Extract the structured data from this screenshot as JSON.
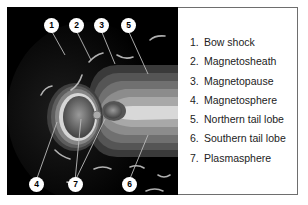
{
  "figure": {
    "panel_background": "#000000",
    "callouts": [
      {
        "id": "1",
        "x": 44,
        "y": 19
      },
      {
        "id": "2",
        "x": 69,
        "y": 19
      },
      {
        "id": "3",
        "x": 94,
        "y": 19
      },
      {
        "id": "4",
        "x": 29,
        "y": 178
      },
      {
        "id": "7",
        "x": 68,
        "y": 178
      },
      {
        "id": "5",
        "x": 121,
        "y": 19
      },
      {
        "id": "6",
        "x": 122,
        "y": 178
      }
    ],
    "legend": {
      "items": [
        {
          "num": "1.",
          "label": "Bow shock"
        },
        {
          "num": "2.",
          "label": "Magnetosheath"
        },
        {
          "num": "3.",
          "label": "Magnetopause"
        },
        {
          "num": "4.",
          "label": "Magnetosphere"
        },
        {
          "num": "5.",
          "label": "Northern tail lobe"
        },
        {
          "num": "6.",
          "label": "Southern tail lobe"
        },
        {
          "num": "7.",
          "label": "Plasmasphere"
        }
      ]
    }
  }
}
